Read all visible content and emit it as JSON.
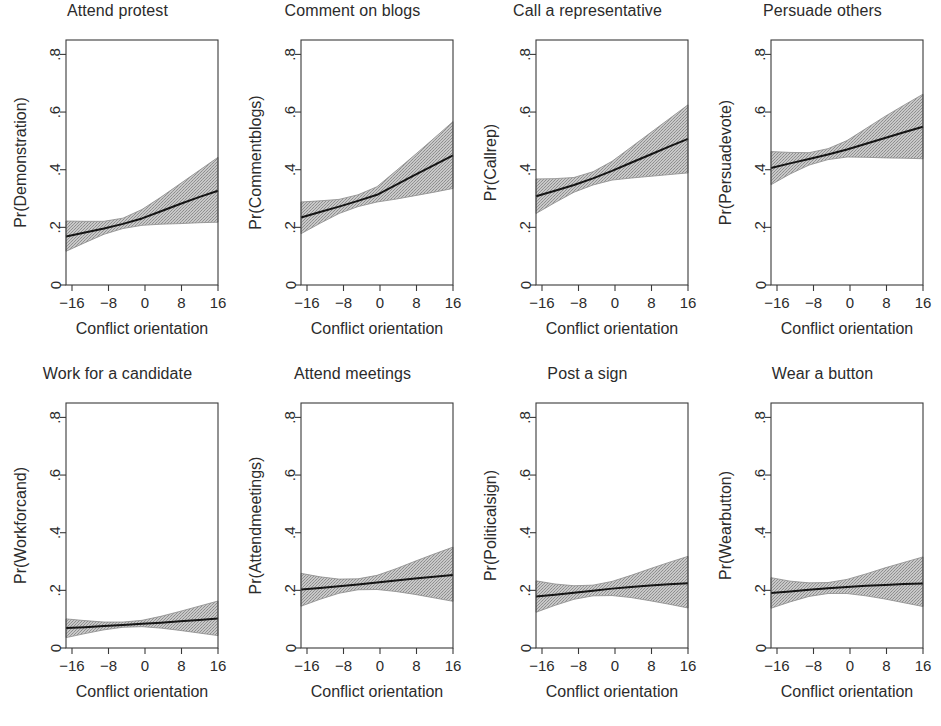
{
  "figure": {
    "xlabel": "Conflict orientation",
    "x_ticks": [
      "-16",
      "-8",
      "0",
      "8",
      "16"
    ],
    "y_ticks": [
      ".8",
      ".6",
      ".4",
      ".2",
      "0"
    ],
    "ribbon_color": "#b3b3b3",
    "line_color": "#141414",
    "frame_color": "#3a3a3a"
  },
  "chart_data": [
    {
      "type": "line",
      "title": "Attend protest",
      "xlabel": "Conflict orientation",
      "ylabel": "Pr(Demonstration)",
      "xlim": [
        -16,
        16
      ],
      "ylim": [
        0,
        0.85
      ],
      "xticks": [
        -16,
        -8,
        0,
        8,
        16
      ],
      "yticks": [
        0,
        0.2,
        0.4,
        0.6,
        0.8
      ],
      "grid": false,
      "legend": "none",
      "x": [
        -16,
        -12,
        -8,
        -4,
        0,
        4,
        8,
        12,
        16
      ],
      "fit": [
        0.168,
        0.182,
        0.196,
        0.212,
        0.231,
        0.256,
        0.281,
        0.305,
        0.327
      ],
      "ci_lower": [
        0.117,
        0.147,
        0.176,
        0.196,
        0.207,
        0.211,
        0.213,
        0.216,
        0.218
      ],
      "ci_upper": [
        0.222,
        0.221,
        0.221,
        0.232,
        0.262,
        0.305,
        0.351,
        0.397,
        0.443
      ]
    },
    {
      "type": "line",
      "title": "Comment on blogs",
      "xlabel": "Conflict orientation",
      "ylabel": "Pr(Commentblogs)",
      "xlim": [
        -16,
        16
      ],
      "ylim": [
        0,
        0.85
      ],
      "xticks": [
        -16,
        -8,
        0,
        8,
        16
      ],
      "yticks": [
        0,
        0.2,
        0.4,
        0.6,
        0.8
      ],
      "grid": false,
      "legend": "none",
      "x": [
        -16,
        -12,
        -8,
        -4,
        0,
        4,
        8,
        12,
        16
      ],
      "fit": [
        0.234,
        0.253,
        0.272,
        0.292,
        0.313,
        0.347,
        0.382,
        0.416,
        0.45
      ],
      "ci_lower": [
        0.178,
        0.214,
        0.248,
        0.272,
        0.288,
        0.298,
        0.31,
        0.322,
        0.335
      ],
      "ci_upper": [
        0.288,
        0.292,
        0.297,
        0.313,
        0.341,
        0.396,
        0.452,
        0.509,
        0.567
      ]
    },
    {
      "type": "line",
      "title": "Call a representative",
      "xlabel": "Conflict orientation",
      "ylabel": "Pr(Callrep)",
      "xlim": [
        -16,
        16
      ],
      "ylim": [
        0,
        0.85
      ],
      "xticks": [
        -16,
        -8,
        0,
        8,
        16
      ],
      "yticks": [
        0,
        0.2,
        0.4,
        0.6,
        0.8
      ],
      "grid": false,
      "legend": "none",
      "x": [
        -16,
        -12,
        -8,
        -4,
        0,
        4,
        8,
        12,
        16
      ],
      "fit": [
        0.308,
        0.327,
        0.347,
        0.37,
        0.396,
        0.424,
        0.452,
        0.48,
        0.507
      ],
      "ci_lower": [
        0.248,
        0.286,
        0.322,
        0.347,
        0.364,
        0.371,
        0.377,
        0.383,
        0.389
      ],
      "ci_upper": [
        0.368,
        0.369,
        0.373,
        0.393,
        0.429,
        0.478,
        0.527,
        0.576,
        0.625
      ]
    },
    {
      "type": "line",
      "title": "Persuade others",
      "xlabel": "Conflict orientation",
      "ylabel": "Pr(Persuadevote)",
      "xlim": [
        -16,
        16
      ],
      "ylim": [
        0,
        0.85
      ],
      "xticks": [
        -16,
        -8,
        0,
        8,
        16
      ],
      "yticks": [
        0,
        0.2,
        0.4,
        0.6,
        0.8
      ],
      "grid": false,
      "legend": "none",
      "x": [
        -16,
        -12,
        -8,
        -4,
        0,
        4,
        8,
        12,
        16
      ],
      "fit": [
        0.406,
        0.422,
        0.437,
        0.453,
        0.47,
        0.49,
        0.51,
        0.53,
        0.549
      ],
      "ci_lower": [
        0.348,
        0.385,
        0.416,
        0.435,
        0.444,
        0.443,
        0.441,
        0.44,
        0.438
      ],
      "ci_upper": [
        0.463,
        0.46,
        0.459,
        0.473,
        0.501,
        0.543,
        0.585,
        0.624,
        0.662
      ]
    },
    {
      "type": "line",
      "title": "Work for a candidate",
      "xlabel": "Conflict orientation",
      "ylabel": "Pr(Workforcand)",
      "xlim": [
        -16,
        16
      ],
      "ylim": [
        0,
        0.85
      ],
      "xticks": [
        -16,
        -8,
        0,
        8,
        16
      ],
      "yticks": [
        0,
        0.2,
        0.4,
        0.6,
        0.8
      ],
      "grid": false,
      "legend": "none",
      "x": [
        -16,
        -12,
        -8,
        -4,
        0,
        4,
        8,
        12,
        16
      ],
      "fit": [
        0.069,
        0.072,
        0.076,
        0.08,
        0.084,
        0.088,
        0.093,
        0.097,
        0.102
      ],
      "ci_lower": [
        0.036,
        0.05,
        0.063,
        0.072,
        0.074,
        0.069,
        0.061,
        0.052,
        0.043
      ],
      "ci_upper": [
        0.101,
        0.095,
        0.09,
        0.09,
        0.096,
        0.11,
        0.127,
        0.145,
        0.163
      ]
    },
    {
      "type": "line",
      "title": "Attend meetings",
      "xlabel": "Conflict orientation",
      "ylabel": "Pr(Attendmeetings)",
      "xlim": [
        -16,
        16
      ],
      "ylim": [
        0,
        0.85
      ],
      "xticks": [
        -16,
        -8,
        0,
        8,
        16
      ],
      "yticks": [
        0,
        0.2,
        0.4,
        0.6,
        0.8
      ],
      "grid": false,
      "legend": "none",
      "x": [
        -16,
        -12,
        -8,
        -4,
        0,
        4,
        8,
        12,
        16
      ],
      "fit": [
        0.203,
        0.208,
        0.214,
        0.22,
        0.227,
        0.234,
        0.241,
        0.247,
        0.253
      ],
      "ci_lower": [
        0.145,
        0.169,
        0.19,
        0.202,
        0.203,
        0.196,
        0.186,
        0.174,
        0.162
      ],
      "ci_upper": [
        0.259,
        0.247,
        0.239,
        0.24,
        0.252,
        0.275,
        0.301,
        0.326,
        0.35
      ]
    },
    {
      "type": "line",
      "title": "Post a sign",
      "xlabel": "Conflict orientation",
      "ylabel": "Pr(Politicalsign)",
      "xlim": [
        -16,
        16
      ],
      "ylim": [
        0,
        0.85
      ],
      "xticks": [
        -16,
        -8,
        0,
        8,
        16
      ],
      "yticks": [
        0,
        0.2,
        0.4,
        0.6,
        0.8
      ],
      "grid": false,
      "legend": "none",
      "x": [
        -16,
        -12,
        -8,
        -4,
        0,
        4,
        8,
        12,
        16
      ],
      "fit": [
        0.179,
        0.185,
        0.192,
        0.199,
        0.206,
        0.212,
        0.217,
        0.221,
        0.225
      ],
      "ci_lower": [
        0.124,
        0.148,
        0.169,
        0.181,
        0.182,
        0.175,
        0.164,
        0.152,
        0.139
      ],
      "ci_upper": [
        0.233,
        0.222,
        0.216,
        0.218,
        0.231,
        0.252,
        0.275,
        0.297,
        0.318
      ]
    },
    {
      "type": "line",
      "title": "Wear a button",
      "xlabel": "Conflict orientation",
      "ylabel": "Pr(Wearbutton)",
      "xlim": [
        -16,
        16
      ],
      "ylim": [
        0,
        0.85
      ],
      "xticks": [
        -16,
        -8,
        0,
        8,
        16
      ],
      "yticks": [
        0,
        0.2,
        0.4,
        0.6,
        0.8
      ],
      "grid": false,
      "legend": "none",
      "x": [
        -16,
        -12,
        -8,
        -4,
        0,
        4,
        8,
        12,
        16
      ],
      "fit": [
        0.191,
        0.196,
        0.202,
        0.207,
        0.212,
        0.216,
        0.219,
        0.222,
        0.224
      ],
      "ci_lower": [
        0.138,
        0.16,
        0.179,
        0.189,
        0.189,
        0.181,
        0.17,
        0.157,
        0.144
      ],
      "ci_upper": [
        0.244,
        0.232,
        0.226,
        0.227,
        0.238,
        0.257,
        0.278,
        0.297,
        0.316
      ]
    }
  ]
}
